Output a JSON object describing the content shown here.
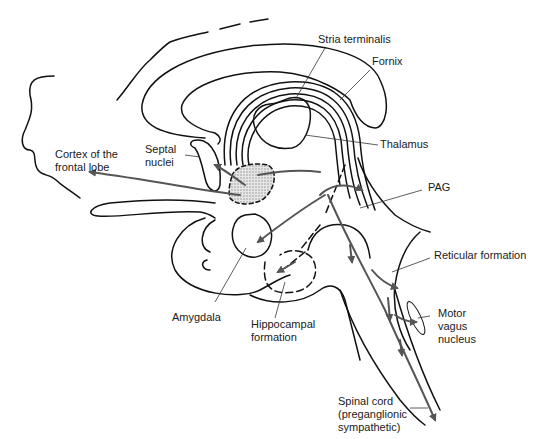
{
  "diagram": {
    "type": "anatomical-sagittal-brain",
    "colors": {
      "outline": "#111111",
      "arrow": "#555555",
      "label_line": "#333333",
      "stipple": "#bbbbbb"
    },
    "labels": {
      "stria_terminalis": "Stria terminalis",
      "fornix": "Fornix",
      "thalamus": "Thalamus",
      "cortex_line1": "Cortex of the",
      "cortex_line2": "frontal lobe",
      "septal_line1": "Septal",
      "septal_line2": "nuclei",
      "pag": "PAG",
      "reticular": "Reticular formation",
      "motor_line1": "Motor",
      "motor_line2": "vagus",
      "motor_line3": "nucleus",
      "amygdala": "Amygdala",
      "hippo_line1": "Hippocampal",
      "hippo_line2": "formation",
      "spinal_line1": "Spinal cord",
      "spinal_line2": "(preganglionic",
      "spinal_line3": "sympathetic)"
    }
  }
}
